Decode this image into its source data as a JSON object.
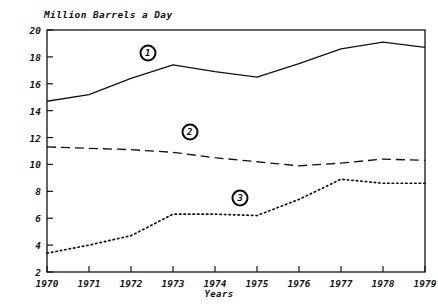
{
  "chart_data": {
    "type": "line",
    "title": "Million Barrels a Day",
    "xlabel": "Years",
    "ylabel": "",
    "grid": false,
    "legend": "inline-numbered-markers",
    "categories": [
      "1970",
      "1971",
      "1972",
      "1973",
      "1974",
      "1975",
      "1976",
      "1977",
      "1978",
      "1979"
    ],
    "x": [
      1970,
      1971,
      1972,
      1973,
      1974,
      1975,
      1976,
      1977,
      1978,
      1979
    ],
    "xlim": [
      1970,
      1979
    ],
    "ylim": [
      2,
      20
    ],
    "ytick_step": 2,
    "yticks": [
      "20",
      "18",
      "16",
      "14",
      "12",
      "10",
      "8",
      "6",
      "4",
      "2"
    ],
    "series": [
      {
        "name": "1",
        "label": "1",
        "style": "solid",
        "values": [
          14.7,
          15.2,
          16.4,
          17.4,
          16.9,
          16.5,
          17.5,
          18.6,
          19.1,
          18.7
        ]
      },
      {
        "name": "2",
        "label": "2",
        "style": "dashed",
        "values": [
          11.3,
          11.2,
          11.1,
          10.9,
          10.5,
          10.2,
          9.9,
          10.1,
          10.4,
          10.3
        ]
      },
      {
        "name": "3",
        "label": "3",
        "style": "dotted",
        "values": [
          3.4,
          4.0,
          4.7,
          6.3,
          6.3,
          6.2,
          7.4,
          8.9,
          8.6,
          8.6
        ]
      }
    ],
    "annotations": [
      {
        "text": "1",
        "series": "1",
        "x": 1972.4,
        "y": 18.3
      },
      {
        "text": "2",
        "series": "2",
        "x": 1973.4,
        "y": 12.4
      },
      {
        "text": "3",
        "series": "3",
        "x": 1974.6,
        "y": 7.5
      }
    ]
  }
}
